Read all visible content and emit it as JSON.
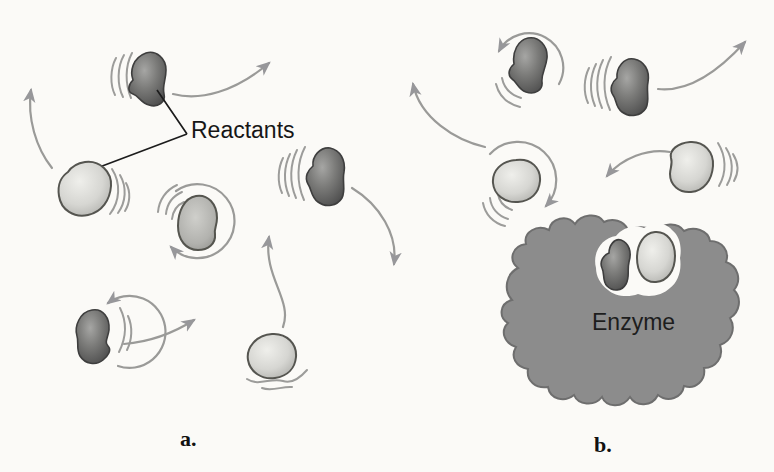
{
  "figure": {
    "labels": {
      "reactants": "Reactants",
      "enzyme": "Enzyme",
      "panel_a_caption": "a.",
      "panel_b_caption": "b."
    },
    "colors": {
      "background": "#fbfaf7",
      "arrow_gray": "#9a9a98",
      "reactant_dark": "#5f5f5f",
      "reactant_light": "#d8d8d4",
      "reactant_mid": "#b5b5b1",
      "enzyme_gray": "#8c8c8c",
      "pocket_outline": "#fbfaf7",
      "text_black": "#1a1a1a"
    }
  }
}
